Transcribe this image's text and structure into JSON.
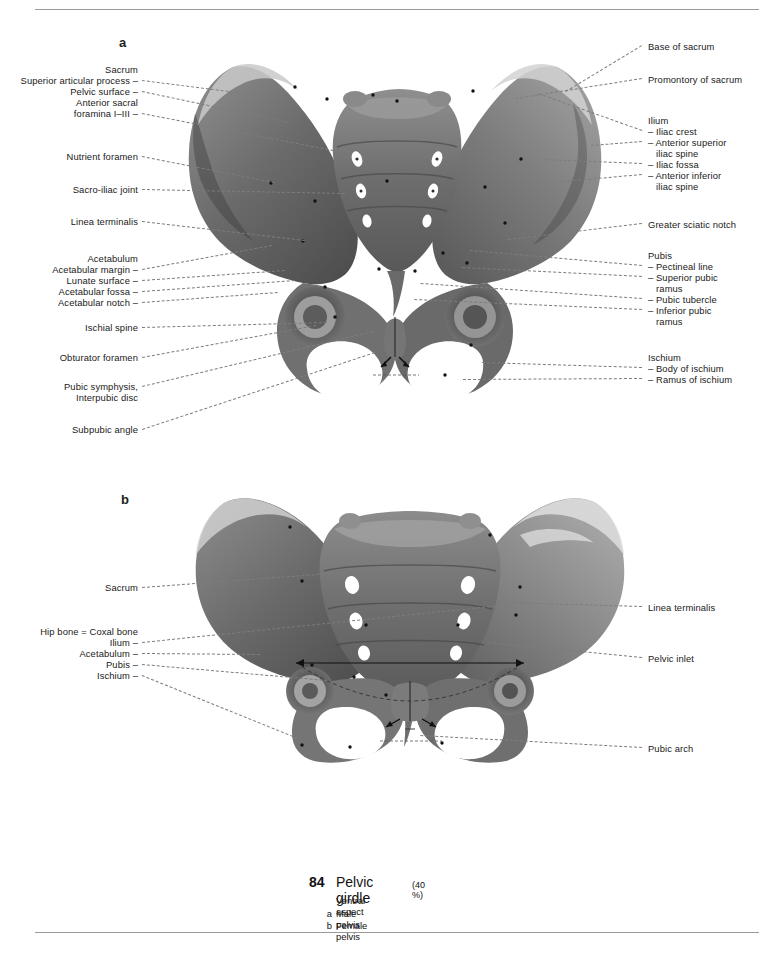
{
  "page": {
    "number": "84",
    "title": "Pelvic girdle",
    "scale": "(40 %)",
    "subtitle": "Ventral aspect",
    "keys": [
      {
        "letter": "a",
        "text": "Male pelvis"
      },
      {
        "letter": "b",
        "text": "Female pelvis"
      }
    ]
  },
  "panels": [
    {
      "letter": "a",
      "caption": "Male pelvis",
      "labels_left": [
        {
          "text": "Sacrum",
          "x": 138,
          "y": 64,
          "lead": false
        },
        {
          "text": "Superior articular process –",
          "x": 138,
          "y": 75,
          "lead": true,
          "tx": 268,
          "ty": 96
        },
        {
          "text": "Pelvic surface –",
          "x": 138,
          "y": 86,
          "lead": true,
          "tx": 289,
          "ty": 122
        },
        {
          "text": "Anterior sacral",
          "x": 138,
          "y": 97,
          "lead": false
        },
        {
          "text": "foramina I–III –",
          "x": 138,
          "y": 108,
          "lead": true,
          "tx": 333,
          "ty": 150
        },
        {
          "text": "Nutrient foramen",
          "x": 138,
          "y": 151,
          "lead": true,
          "tx": 274,
          "ty": 182
        },
        {
          "text": "Sacro-iliac joint",
          "x": 138,
          "y": 184,
          "lead": true,
          "tx": 345,
          "ty": 193
        },
        {
          "text": "Linea terminalis",
          "x": 138,
          "y": 216,
          "lead": true,
          "tx": 305,
          "ty": 240
        },
        {
          "text": "Acetabulum",
          "x": 138,
          "y": 253,
          "lead": false
        },
        {
          "text": "Acetabular margin –",
          "x": 138,
          "y": 264,
          "lead": true,
          "tx": 272,
          "ty": 245
        },
        {
          "text": "Lunate surface –",
          "x": 138,
          "y": 275,
          "lead": true,
          "tx": 285,
          "ty": 270
        },
        {
          "text": "Acetabular fossa –",
          "x": 138,
          "y": 286,
          "lead": true,
          "tx": 295,
          "ty": 280
        },
        {
          "text": "Acetabular notch –",
          "x": 138,
          "y": 297,
          "lead": true,
          "tx": 278,
          "ty": 292
        },
        {
          "text": "Ischial spine",
          "x": 138,
          "y": 322,
          "lead": true,
          "tx": 327,
          "ty": 322
        },
        {
          "text": "Obturator foramen",
          "x": 138,
          "y": 352,
          "lead": true,
          "tx": 316,
          "ty": 325
        },
        {
          "text": "Pubic symphysis,",
          "x": 138,
          "y": 381,
          "lead": true,
          "tx": 373,
          "ty": 331
        },
        {
          "text": "Interpubic disc",
          "x": 138,
          "y": 392,
          "lead": false
        },
        {
          "text": "Subpubic angle",
          "x": 138,
          "y": 424,
          "lead": true,
          "tx": 375,
          "ty": 352
        }
      ],
      "labels_right": [
        {
          "text": "Base of sacrum",
          "x": 648,
          "y": 41,
          "lead": true,
          "tx": 566,
          "ty": 92
        },
        {
          "text": "Promontory of sacrum",
          "x": 648,
          "y": 74,
          "lead": true,
          "tx": 516,
          "ty": 99
        },
        {
          "text": "Ilium",
          "x": 648,
          "y": 115,
          "lead": false
        },
        {
          "text": "– Iliac crest",
          "x": 648,
          "y": 126,
          "lead": true,
          "tx": 538,
          "ty": 94
        },
        {
          "text": "– Anterior superior",
          "x": 648,
          "y": 137,
          "lead": true,
          "tx": 591,
          "ty": 146
        },
        {
          "text": "   iliac spine",
          "x": 648,
          "y": 148,
          "lead": false
        },
        {
          "text": "– Iliac fossa",
          "x": 648,
          "y": 159,
          "lead": true,
          "tx": 543,
          "ty": 160
        },
        {
          "text": "– Anterior inferior",
          "x": 648,
          "y": 170,
          "lead": true,
          "tx": 563,
          "ty": 182
        },
        {
          "text": "   iliac spine",
          "x": 648,
          "y": 181,
          "lead": false
        },
        {
          "text": "Greater sciatic notch",
          "x": 648,
          "y": 219,
          "lead": true,
          "tx": 508,
          "ty": 240
        },
        {
          "text": "Pubis",
          "x": 648,
          "y": 250,
          "lead": false
        },
        {
          "text": "– Pectineal line",
          "x": 648,
          "y": 261,
          "lead": true,
          "tx": 470,
          "ty": 251
        },
        {
          "text": "– Superior pubic",
          "x": 648,
          "y": 272,
          "lead": true,
          "tx": 462,
          "ty": 268
        },
        {
          "text": "   ramus",
          "x": 648,
          "y": 283,
          "lead": false
        },
        {
          "text": "– Pubic tubercle",
          "x": 648,
          "y": 294,
          "lead": true,
          "tx": 421,
          "ty": 284
        },
        {
          "text": "– Inferior pubic",
          "x": 648,
          "y": 305,
          "lead": true,
          "tx": 414,
          "ty": 300
        },
        {
          "text": "   ramus",
          "x": 648,
          "y": 316,
          "lead": false
        },
        {
          "text": "Ischium",
          "x": 648,
          "y": 352,
          "lead": false
        },
        {
          "text": "– Body of ischium",
          "x": 648,
          "y": 363,
          "lead": true,
          "tx": 482,
          "ty": 363
        },
        {
          "text": "– Ramus of ischium",
          "x": 648,
          "y": 374,
          "lead": true,
          "tx": 463,
          "ty": 380
        }
      ]
    },
    {
      "letter": "b",
      "caption": "Female pelvis",
      "labels_left": [
        {
          "text": "Sacrum",
          "x": 138,
          "y": 582,
          "lead": true,
          "tx": 344,
          "ty": 572
        },
        {
          "text": "Hip bone = Coxal bone",
          "x": 138,
          "y": 626,
          "lead": false
        },
        {
          "text": "Ilium –",
          "x": 138,
          "y": 637,
          "lead": true,
          "tx": 510,
          "ty": 604
        },
        {
          "text": "Acetabulum –",
          "x": 138,
          "y": 648,
          "lead": true,
          "tx": 260,
          "ty": 654
        },
        {
          "text": "Pubis –",
          "x": 138,
          "y": 659,
          "lead": true,
          "tx": 327,
          "ty": 680
        },
        {
          "text": "Ischium –",
          "x": 138,
          "y": 670,
          "lead": true,
          "tx": 298,
          "ty": 738
        }
      ],
      "labels_right": [
        {
          "text": "Linea terminalis",
          "x": 648,
          "y": 602,
          "lead": true,
          "tx": 501,
          "ty": 603
        },
        {
          "text": "Pelvic inlet",
          "x": 648,
          "y": 653,
          "lead": true,
          "tx": 488,
          "ty": 643
        },
        {
          "text": "Pubic arch",
          "x": 648,
          "y": 743,
          "lead": true,
          "tx": 420,
          "ty": 736
        }
      ]
    }
  ]
}
